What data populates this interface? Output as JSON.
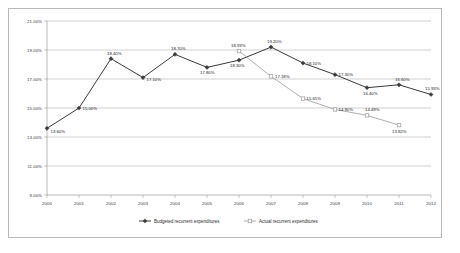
{
  "chart_data": {
    "type": "line",
    "title": "",
    "subtitle": "",
    "xlabel": "",
    "ylabel": "",
    "grid": true,
    "legend_position": "bottom",
    "ylim": [
      9.0,
      21.0
    ],
    "y_tick_labels": [
      "21.00%",
      "19.00%",
      "17.00%",
      "15.00%",
      "13.00%",
      "11.00%",
      "9.00%"
    ],
    "y_tick_values": [
      21.0,
      19.0,
      17.0,
      15.0,
      13.0,
      11.0,
      9.0
    ],
    "categories": [
      "2000",
      "2001",
      "2002",
      "2003",
      "2004",
      "2005",
      "2006",
      "2007",
      "2008",
      "2009",
      "2010",
      "2011",
      "2012"
    ],
    "series": [
      {
        "name": "Budgeted recurrent expenditures",
        "color": "#3b3b3b",
        "marker": "diamond",
        "values": [
          13.6,
          15.0,
          18.4,
          17.1,
          18.7,
          17.8,
          18.3,
          19.2,
          18.1,
          17.3,
          16.4,
          16.6,
          15.93
        ],
        "labels": [
          "13.60%",
          "15.00%",
          "18.40%",
          "17.10%",
          "18.70%",
          "17.80%",
          "18.30%",
          "19.20%",
          "18.10%",
          "17.30%",
          "16.40%",
          "16.60%",
          "15.93%"
        ]
      },
      {
        "name": "Actual recurrent expenditures",
        "color": "#a6a6a6",
        "marker": "square",
        "values": [
          null,
          null,
          null,
          null,
          null,
          null,
          18.93,
          17.18,
          15.65,
          14.9,
          14.49,
          13.82,
          null
        ],
        "labels": [
          "",
          "",
          "",
          "",
          "",
          "",
          "18.93%",
          "17.18%",
          "15.65%",
          "14.90%",
          "14.49%",
          "13.82%",
          ""
        ]
      }
    ]
  },
  "legend": {
    "items": [
      {
        "label": "Budgeted recurrent expenditures"
      },
      {
        "label": "Actual recurrent expenditures"
      }
    ]
  }
}
